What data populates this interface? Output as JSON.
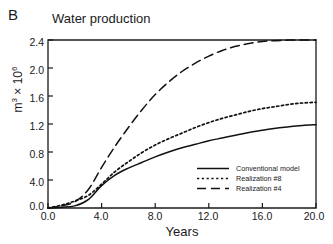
{
  "panel": {
    "label": "B"
  },
  "title": "Water production",
  "axes": {
    "ylabel_main": "m",
    "ylabel_exp": "3",
    "ylabel_mult": " × 10",
    "ylabel_mult_exp": "6",
    "ylabel_full": "m3 × 106",
    "xlabel": "Years"
  },
  "legend": {
    "items": [
      {
        "label": "Conventional model",
        "style": "solid"
      },
      {
        "label": "Realization #8",
        "style": "dotted"
      },
      {
        "label": "Realization #4",
        "style": "dashed"
      }
    ]
  },
  "chart_data": {
    "type": "line",
    "title": "Water production",
    "xlabel": "Years",
    "ylabel": "m3 × 106",
    "xlim": [
      0.0,
      20.0
    ],
    "ylim": [
      0.0,
      2.4
    ],
    "xticks": [
      0.0,
      4.0,
      8.0,
      12.0,
      16.0,
      20.0
    ],
    "xtick_labels": [
      "0.0",
      "4.0",
      "8.0",
      "12.0",
      "16.0",
      "20.0"
    ],
    "yticks": [
      0.0,
      0.4,
      0.8,
      1.2,
      1.6,
      2.0,
      2.4
    ],
    "ytick_labels": [
      "0.0",
      "4.0",
      "0.8",
      "1.2",
      "1.6",
      "2.0",
      "2.4"
    ],
    "ytick_label_note": "second tick printed as 4.0 in original figure (typo for 0.4)",
    "grid": false,
    "legend_position": "lower-right-inside",
    "x": [
      0.0,
      1.0,
      2.0,
      3.0,
      4.0,
      5.0,
      6.0,
      7.0,
      8.0,
      9.0,
      10.0,
      11.0,
      12.0,
      13.0,
      14.0,
      15.0,
      16.0,
      17.0,
      18.0,
      19.0,
      20.0
    ],
    "series": [
      {
        "name": "Conventional model",
        "style": "solid",
        "values": [
          0.0,
          0.01,
          0.03,
          0.12,
          0.32,
          0.47,
          0.57,
          0.65,
          0.73,
          0.8,
          0.86,
          0.91,
          0.96,
          1.0,
          1.04,
          1.08,
          1.11,
          1.14,
          1.16,
          1.18,
          1.19
        ]
      },
      {
        "name": "Realization #8",
        "style": "dotted",
        "values": [
          0.0,
          0.04,
          0.1,
          0.18,
          0.34,
          0.52,
          0.66,
          0.79,
          0.9,
          0.99,
          1.07,
          1.15,
          1.22,
          1.28,
          1.33,
          1.38,
          1.42,
          1.45,
          1.48,
          1.5,
          1.51
        ]
      },
      {
        "name": "Realization #4",
        "style": "dashed",
        "values": [
          0.0,
          0.03,
          0.09,
          0.26,
          0.58,
          0.88,
          1.15,
          1.4,
          1.62,
          1.8,
          1.95,
          2.07,
          2.17,
          2.25,
          2.31,
          2.35,
          2.38,
          2.39,
          2.4,
          2.4,
          2.4
        ]
      }
    ]
  },
  "colors": {
    "ink": "#111111",
    "axis": "#1a1a1a",
    "background": "#ffffff"
  }
}
